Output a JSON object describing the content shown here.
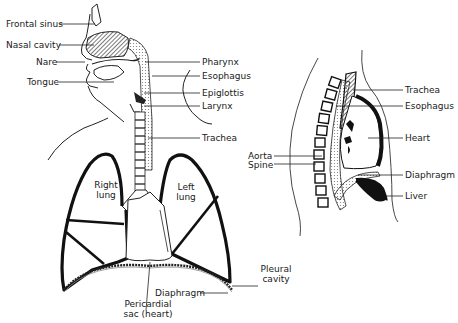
{
  "front_view": {
    "labels": {
      "frontal_sinus": "Frontal sinus",
      "nasal_cavity": "Nasal cavity",
      "nare": "Nare",
      "tongue": "Tongue",
      "pharynx": "Pharynx",
      "esophagus": "Esophagus",
      "epiglottis": "Epiglottis",
      "larynx": "Larynx",
      "trachea": "Trachea",
      "right_lung_1": "Right",
      "right_lung_2": "lung",
      "left_lung_1": "Left",
      "left_lung_2": "lung",
      "diaphragm": "Diaphragm",
      "pleural_cavity_1": "Pleural",
      "pleural_cavity_2": "cavity",
      "pericardial_sac_1": "Pericardial",
      "pericardial_sac_2": "sac (heart)"
    }
  },
  "side_view": {
    "labels": {
      "trachea": "Trachea",
      "esophagus": "Esophagus",
      "heart": "Heart",
      "aorta": "Aorta",
      "spine": "Spine",
      "diaphragm": "Diaphragm",
      "liver": "Liver"
    }
  },
  "colors": {
    "ink": "#1a1a1a",
    "background": "#ffffff"
  }
}
